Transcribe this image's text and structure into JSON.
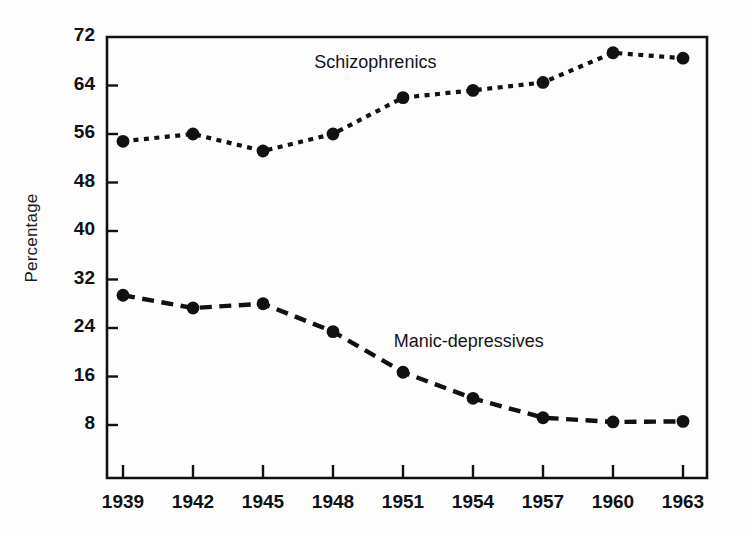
{
  "chart_data": {
    "type": "line",
    "title": "",
    "xlabel": "",
    "ylabel": "Percentage",
    "x": [
      1939,
      1942,
      1945,
      1948,
      1951,
      1954,
      1957,
      1960,
      1963
    ],
    "xtick_labels": [
      "1939",
      "1942",
      "1945",
      "1948",
      "1951",
      "1954",
      "1957",
      "1960",
      "1963"
    ],
    "ytick_labels": [
      "8",
      "16",
      "24",
      "32",
      "40",
      "48",
      "56",
      "64",
      "72"
    ],
    "ytick_values": [
      8,
      16,
      24,
      32,
      40,
      48,
      56,
      64,
      72
    ],
    "ylim": [
      4,
      72
    ],
    "xlim": [
      1937.3,
      1963.7
    ],
    "grid": false,
    "legend_position": "inline-annotation",
    "series": [
      {
        "name": "Schizophrenics",
        "label": "Schizophrenics",
        "values": [
          54.8,
          56.0,
          53.2,
          56.0,
          62.0,
          63.2,
          64.5,
          69.4,
          68.5
        ],
        "line_style": "dotted",
        "marker": "filled-circle",
        "color": "#111111",
        "label_x": 1947.2,
        "label_y": 67.5
      },
      {
        "name": "Manic-depressives",
        "label": "Manic-depressives",
        "values": [
          29.4,
          27.3,
          28.0,
          23.4,
          16.7,
          12.4,
          9.2,
          8.5,
          8.6
        ],
        "line_style": "dashed",
        "marker": "filled-circle",
        "color": "#111111",
        "label_x": 1950.6,
        "label_y": 21.5
      }
    ]
  },
  "colors": {
    "ink": "#111111",
    "background": "#fdfdfd"
  }
}
